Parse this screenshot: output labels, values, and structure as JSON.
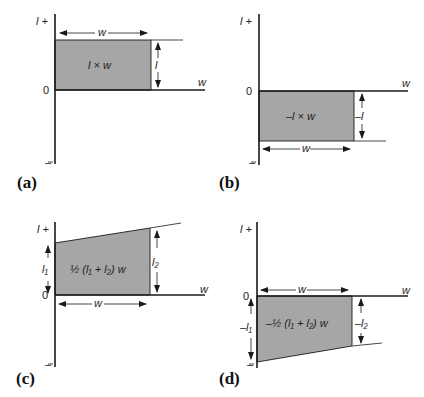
{
  "figure": {
    "panels": [
      {
        "id": "a",
        "label": "(a)",
        "y_axis_top": "l +",
        "y_axis_bottom": "–",
        "origin": "0",
        "x_axis_label": "w",
        "width_label": "w",
        "height_label": "l",
        "area_formula": "l × w",
        "shape": "rectangle above axis"
      },
      {
        "id": "b",
        "label": "(b)",
        "y_axis_top": "l +",
        "y_axis_bottom": "–",
        "origin": "0",
        "x_axis_label": "w",
        "width_label": "w",
        "height_label": "–l",
        "area_formula": "–l × w",
        "shape": "rectangle below axis"
      },
      {
        "id": "c",
        "label": "(c)",
        "y_axis_top": "l +",
        "y_axis_bottom": "–",
        "origin": "0",
        "x_axis_label": "w",
        "width_label": "w",
        "left_height_label": "l₁",
        "right_height_label": "l₂",
        "area_formula": "½ (l₁ + l₂) w",
        "shape": "trapezoid above axis"
      },
      {
        "id": "d",
        "label": "(d)",
        "y_axis_top": "l +",
        "y_axis_bottom": "–",
        "origin": "0",
        "x_axis_label": "w",
        "width_label": "w",
        "left_height_label": "–l₁",
        "right_height_label": "–l₂",
        "area_formula": "–½ (l₁ + l₂) w",
        "shape": "trapezoid below axis"
      }
    ],
    "colors": {
      "shade": "#a6a6a6",
      "line": "#1a1a1a",
      "background": "#ffffff"
    }
  }
}
